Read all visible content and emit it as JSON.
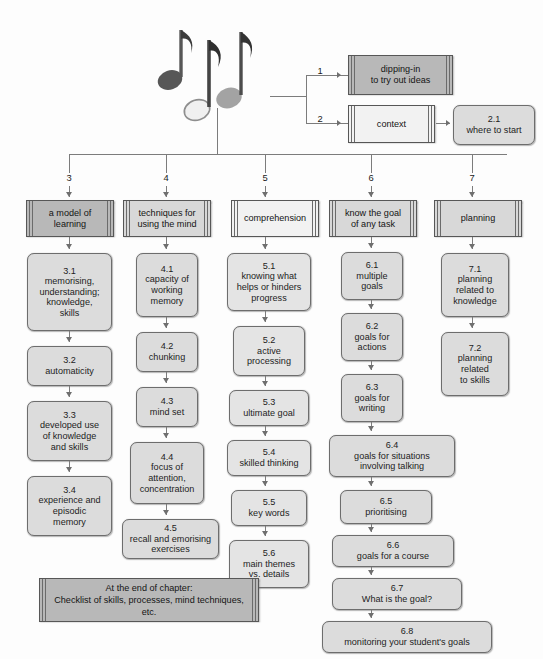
{
  "diagram": {
    "icon": "music-notes-icon",
    "colors": {
      "box_fill_dark": "#b8b8b8",
      "box_fill_mid": "#d8d8d8",
      "box_fill_light": "#f2f2f2",
      "node_fill": "#dcdcdc",
      "line": "#7c7c7c",
      "text": "#1d1d1d"
    }
  },
  "connector_labels": {
    "one": "1",
    "two": "2"
  },
  "top_nodes": [
    {
      "id": "dipping-in",
      "num": "1",
      "line1": "dipping-in",
      "line2": "to try out ideas",
      "tone": "dark"
    },
    {
      "id": "context",
      "num": "2",
      "line1": "context",
      "line2": "",
      "tone": "light"
    },
    {
      "id": "where-to-start",
      "num": "2.1",
      "line1": "where to start",
      "line2": "",
      "tone": "node"
    }
  ],
  "branch_labels": [
    "3",
    "4",
    "5",
    "6",
    "7"
  ],
  "columns": [
    {
      "id": "col-3",
      "branch": "3",
      "header": {
        "line1": "a model of",
        "line2": "learning",
        "tone": "dark"
      },
      "items": [
        {
          "num": "3.1",
          "text": "memorising,\nunderstanding;\nknowledge,\nskills"
        },
        {
          "num": "3.2",
          "text": "automaticity"
        },
        {
          "num": "3.3",
          "text": "developed use\nof knowledge\nand skills"
        },
        {
          "num": "3.4",
          "text": "experience and\nepisodic\nmemory"
        }
      ]
    },
    {
      "id": "col-4",
      "branch": "4",
      "header": {
        "line1": "techniques for",
        "line2": "using the mind",
        "tone": "mid"
      },
      "items": [
        {
          "num": "4.1",
          "text": "capacity of\nworking\nmemory"
        },
        {
          "num": "4.2",
          "text": "chunking"
        },
        {
          "num": "4.3",
          "text": "mind set"
        },
        {
          "num": "4.4",
          "text": "focus of\nattention,\nconcentration"
        },
        {
          "num": "4.5",
          "text": "recall and emorising\nexercises"
        }
      ]
    },
    {
      "id": "col-5",
      "branch": "5",
      "header": {
        "line1": "comprehension",
        "line2": "",
        "tone": "light"
      },
      "items": [
        {
          "num": "5.1",
          "text": "knowing what\nhelps or hinders\nprogress"
        },
        {
          "num": "5.2",
          "text": "active\nprocessing"
        },
        {
          "num": "5.3",
          "text": "ultimate goal"
        },
        {
          "num": "5.4",
          "text": "skilled thinking"
        },
        {
          "num": "5.5",
          "text": "key words"
        },
        {
          "num": "5.6",
          "text": "main themes\nvs. details"
        }
      ]
    },
    {
      "id": "col-6",
      "branch": "6",
      "header": {
        "line1": "know the goal",
        "line2": "of any task",
        "tone": "mid"
      },
      "items": [
        {
          "num": "6.1",
          "text": "multiple\ngoals"
        },
        {
          "num": "6.2",
          "text": "goals for\nactions"
        },
        {
          "num": "6.3",
          "text": "goals for\nwriting"
        },
        {
          "num": "6.4",
          "text": "goals for situations\ninvolving talking"
        },
        {
          "num": "6.5",
          "text": "prioritising"
        },
        {
          "num": "6.6",
          "text": "goals for a course"
        },
        {
          "num": "6.7",
          "text": "What is the goal?"
        },
        {
          "num": "6.8",
          "text": "monitoring your student's goals"
        }
      ]
    },
    {
      "id": "col-7",
      "branch": "7",
      "header": {
        "line1": "planning",
        "line2": "",
        "tone": "mid"
      },
      "items": [
        {
          "num": "7.1",
          "text": "planning\nrelated to\nknowledge"
        },
        {
          "num": "7.2",
          "text": "planning\nrelated\nto skills"
        }
      ]
    }
  ],
  "footer": {
    "line1": "At the end of chapter:",
    "line2": "Checklist of skills, processes, mind techniques,",
    "line3": "etc."
  }
}
